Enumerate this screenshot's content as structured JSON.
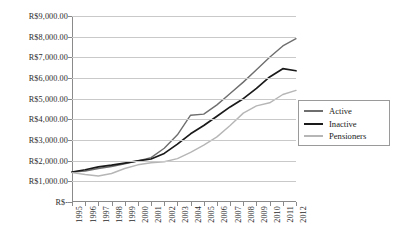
{
  "chart_data": {
    "type": "line",
    "title": "",
    "xlabel": "",
    "ylabel": "",
    "x": [
      1995,
      1996,
      1997,
      1998,
      1999,
      2000,
      2001,
      2002,
      2003,
      2004,
      2005,
      2006,
      2007,
      2008,
      2009,
      2010,
      2011,
      2012
    ],
    "categories": [
      "1995",
      "1996",
      "1997",
      "1998",
      "1999",
      "2000",
      "2001",
      "2002",
      "2003",
      "2004",
      "2005",
      "2006",
      "2007",
      "2008",
      "2009",
      "2010",
      "2011",
      "2012"
    ],
    "series": [
      {
        "name": "Active",
        "color": "#6e6e6e",
        "values": [
          1450,
          1500,
          1620,
          1720,
          1850,
          1990,
          2150,
          2600,
          3250,
          4200,
          4250,
          4700,
          5250,
          5800,
          6400,
          7000,
          7550,
          7900
        ]
      },
      {
        "name": "Inactive",
        "color": "#1a1a1a",
        "values": [
          1450,
          1560,
          1700,
          1780,
          1880,
          1990,
          2080,
          2350,
          2800,
          3300,
          3700,
          4150,
          4600,
          5000,
          5500,
          6050,
          6450,
          6350
        ]
      },
      {
        "name": "Pensioners",
        "color": "#b6b6b6",
        "values": [
          1420,
          1330,
          1260,
          1380,
          1620,
          1800,
          1900,
          1950,
          2100,
          2400,
          2750,
          3150,
          3700,
          4300,
          4650,
          4800,
          5200,
          5400
        ]
      }
    ],
    "ylim": [
      0,
      9000
    ],
    "ytick_values": [
      0,
      1000,
      2000,
      3000,
      4000,
      5000,
      6000,
      7000,
      8000,
      9000
    ],
    "ytick_labels": [
      "R$-",
      "R$1,000.00",
      "R$2,000.00",
      "R$3,000.00",
      "R$4,000.00",
      "R$5,000.00",
      "R$6,000.00",
      "R$7,000.00",
      "R$8,000.00",
      "R$9,000.00"
    ],
    "grid": true,
    "legend_position": "right"
  },
  "legend": {
    "items": [
      {
        "label": "Active"
      },
      {
        "label": "Inactive"
      },
      {
        "label": "Pensioners"
      }
    ]
  }
}
